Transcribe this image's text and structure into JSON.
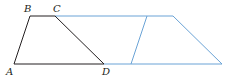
{
  "diagram": {
    "colors": {
      "original": "#231f20",
      "translated": "#5b9bd5"
    },
    "labels": {
      "A": "A",
      "B": "B",
      "C": "C",
      "D": "D"
    }
  }
}
